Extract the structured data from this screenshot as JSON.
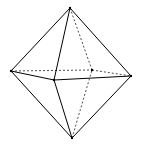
{
  "diagram": {
    "stroke_color": "#000000",
    "background": "#ffffff",
    "vertices": {
      "top": [
        70,
        8
      ],
      "left": [
        11,
        71
      ],
      "front": [
        54,
        80
      ],
      "right": [
        131,
        76
      ],
      "back": [
        92,
        70
      ],
      "bottom": [
        72,
        138
      ]
    },
    "solid_edges": [
      [
        "top",
        "left"
      ],
      [
        "top",
        "front"
      ],
      [
        "top",
        "right"
      ],
      [
        "left",
        "front"
      ],
      [
        "front",
        "right"
      ],
      [
        "bottom",
        "left"
      ],
      [
        "bottom",
        "front"
      ],
      [
        "bottom",
        "right"
      ]
    ],
    "hidden_edges": [
      [
        "top",
        "back"
      ],
      [
        "left",
        "back"
      ],
      [
        "back",
        "right"
      ],
      [
        "bottom",
        "back"
      ]
    ]
  }
}
